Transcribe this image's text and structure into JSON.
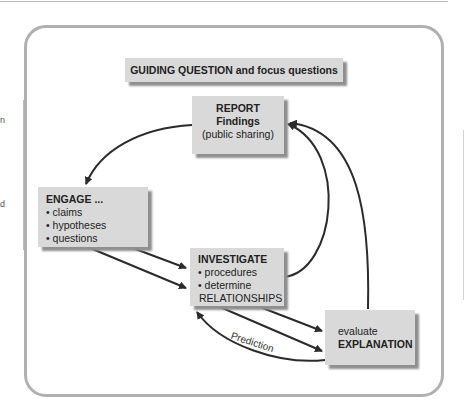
{
  "page": {
    "side_fragments": [
      "n",
      "d"
    ]
  },
  "diagram": {
    "title_box": "GUIDING QUESTION and focus questions",
    "report": {
      "line1": "REPORT",
      "line2": "Findings",
      "line3": "(public sharing)"
    },
    "engage": {
      "title": "ENGAGE ...",
      "bullets": [
        "claims",
        "hypotheses",
        "questions"
      ]
    },
    "investigate": {
      "title": "INVESTIGATE",
      "bullets": [
        "procedures",
        "determine"
      ],
      "continuation": "RELATIONSHIPS"
    },
    "evaluate": {
      "line1": "evaluate",
      "line2": "EXPLANATION"
    },
    "arrow_label": "Prediction",
    "colors": {
      "box_fill": "#d9d9d9",
      "box_shadow": "#8f8f8f",
      "frame": "#b0b0b0",
      "arrow": "#2b2b2b"
    }
  }
}
